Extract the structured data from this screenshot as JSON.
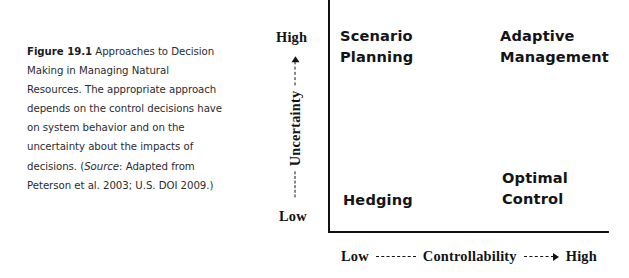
{
  "caption": {
    "label": "Figure 19.1",
    "body_before_source": "  Approaches to Decision Making in Managing Natural Resources. The appropriate approach depends on the control decisions have on system behavior and on the uncertainty about the impacts of decisions. (",
    "source_word": "Source",
    "body_after_source": ": Adapted from Peterson et al. 2003; U.S. DOI 2009.)"
  },
  "chart_data": {
    "type": "scatter",
    "title": "Approaches to Decision Making in Managing Natural Resources",
    "xlabel": "Controllability",
    "ylabel": "Uncertainty",
    "x_axis": {
      "label": "Controllability",
      "low_label": "Low",
      "high_label": "High",
      "direction": "increasing-right",
      "dash_left": "-----",
      "dash_right": "---->"
    },
    "y_axis": {
      "label": "Uncertainty",
      "low_label": "Low",
      "high_label": "High",
      "direction": "increasing-up",
      "dash_low": "-----",
      "dash_high": "---->"
    },
    "grid": false,
    "legend": "none",
    "quadrants": [
      {
        "id": "scenario-planning",
        "label": "Scenario\nPlanning",
        "uncertainty": "High",
        "controllability": "Low",
        "position": "top-left"
      },
      {
        "id": "adaptive-management",
        "label": "Adaptive\nManagement",
        "uncertainty": "High",
        "controllability": "High",
        "position": "top-right"
      },
      {
        "id": "hedging",
        "label": "Hedging",
        "uncertainty": "Low",
        "controllability": "Low",
        "position": "bottom-left"
      },
      {
        "id": "optimal-control",
        "label": "Optimal\nControl",
        "uncertainty": "Low",
        "controllability": "High",
        "position": "bottom-right"
      }
    ],
    "colors": {
      "axis": "#131316",
      "text": "#141418",
      "caption": "#2b2b2f",
      "background": "#ffffff"
    }
  }
}
